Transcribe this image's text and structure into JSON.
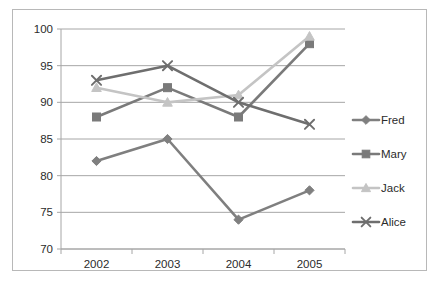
{
  "chart_data": {
    "type": "line",
    "title": "",
    "subtitle": "",
    "xlabel": "",
    "ylabel": "",
    "categories": [
      "2002",
      "2003",
      "2004",
      "2005"
    ],
    "x": [
      2002,
      2003,
      2004,
      2005
    ],
    "ylim": [
      70,
      100
    ],
    "yticks": [
      "70",
      "75",
      "80",
      "85",
      "90",
      "95",
      "100"
    ],
    "ytick_values": [
      70,
      75,
      80,
      85,
      90,
      95,
      100
    ],
    "grid": "horizontal",
    "legend_position": "right",
    "series": [
      {
        "name": "Fred",
        "marker": "diamond",
        "color": "#7f7f7f",
        "values": [
          82,
          85,
          74,
          78
        ]
      },
      {
        "name": "Mary",
        "marker": "square",
        "color": "#7a7a7a",
        "values": [
          88,
          92,
          88,
          98
        ]
      },
      {
        "name": "Jack",
        "marker": "triangle",
        "color": "#c4c4c4",
        "values": [
          92,
          90,
          91,
          99
        ]
      },
      {
        "name": "Alice",
        "marker": "x",
        "color": "#6e6e6e",
        "values": [
          93,
          95,
          90,
          87
        ]
      }
    ]
  },
  "legend": {
    "items": [
      {
        "label": "Fred"
      },
      {
        "label": "Mary"
      },
      {
        "label": "Jack"
      },
      {
        "label": "Alice"
      }
    ]
  },
  "colors": {
    "frame_border": "#b8b8b8",
    "gridline": "#a6a6a6",
    "axis": "#a6a6a6",
    "text": "#2b2b2b",
    "background": "#ffffff"
  }
}
